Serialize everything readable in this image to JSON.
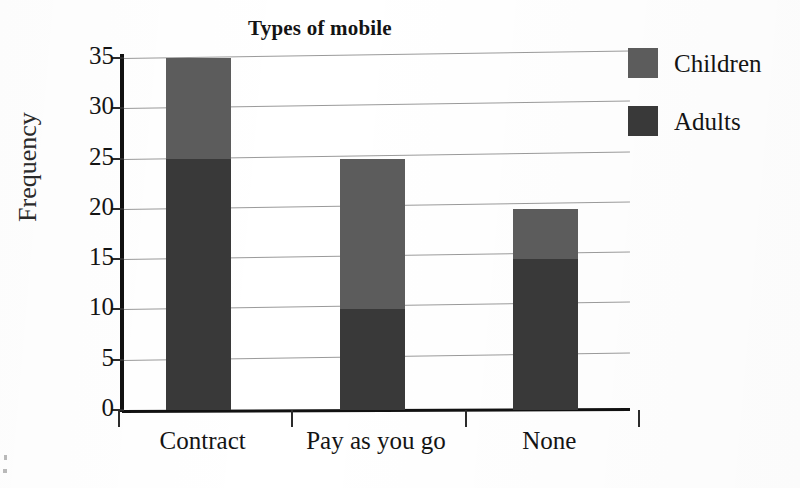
{
  "chart_data": {
    "type": "bar",
    "subtype": "stacked-vertical",
    "title": "Types of mobile",
    "xlabel": "",
    "ylabel": "Frequency",
    "categories": [
      "Contract",
      "Pay as you go",
      "None"
    ],
    "series": [
      {
        "name": "Adults",
        "values": [
          25,
          10,
          15
        ],
        "color": "#393939"
      },
      {
        "name": "Children",
        "values": [
          10,
          15,
          5
        ],
        "color": "#5c5c5c"
      }
    ],
    "totals": [
      35,
      25,
      20
    ],
    "ylim": [
      0,
      35
    ],
    "ytick_step": 5,
    "yticks": [
      0,
      5,
      10,
      15,
      20,
      25,
      30,
      35
    ],
    "ytick_labels": [
      "0",
      "5",
      "10",
      "15",
      "20",
      "25",
      "30",
      "35"
    ],
    "grid": true,
    "grid_axis": "y",
    "legend_position": "right",
    "legend_entries": [
      "Children",
      "Adults"
    ],
    "stack_order_bottom_to_top": [
      "Adults",
      "Children"
    ]
  },
  "figure": {
    "title": "Types of mobile",
    "y_axis_title": "Frequency",
    "background_color": "#ffffff",
    "axis_color": "#111111",
    "gridline_color": "#9a9a9a"
  },
  "legend": {
    "items": [
      {
        "label": "Children",
        "color": "#5c5c5c"
      },
      {
        "label": "Adults",
        "color": "#393939"
      }
    ]
  },
  "y_axis": {
    "ticks": [
      {
        "value": 35,
        "label": "35"
      },
      {
        "value": 30,
        "label": "30"
      },
      {
        "value": 25,
        "label": "25"
      },
      {
        "value": 20,
        "label": "20"
      },
      {
        "value": 15,
        "label": "15"
      },
      {
        "value": 10,
        "label": "10"
      },
      {
        "value": 5,
        "label": "5"
      },
      {
        "value": 0,
        "label": "0"
      }
    ]
  },
  "x_axis": {
    "categories": [
      {
        "label": "Contract"
      },
      {
        "label": "Pay as you go"
      },
      {
        "label": "None"
      }
    ]
  },
  "bars": [
    {
      "category": "Contract",
      "adults": 25,
      "children": 10,
      "total": 35
    },
    {
      "category": "Pay as you go",
      "adults": 10,
      "children": 15,
      "total": 25
    },
    {
      "category": "None",
      "adults": 15,
      "children": 5,
      "total": 20
    }
  ]
}
